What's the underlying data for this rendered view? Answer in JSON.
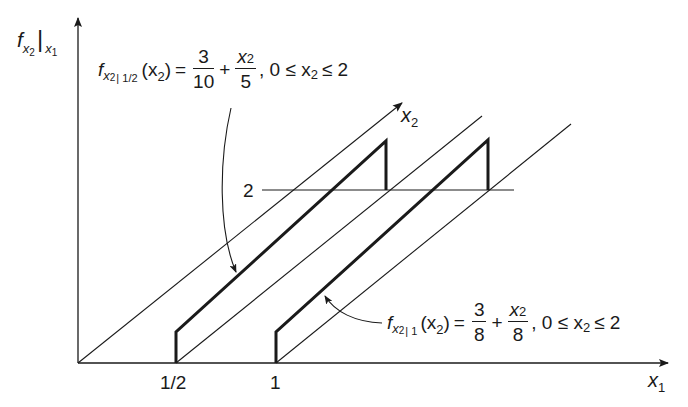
{
  "diagram": {
    "type": "3d-conditional-density-plot",
    "colors": {
      "ink": "#1a1a1a",
      "background": "#ffffff"
    },
    "axes": {
      "vertical": {
        "label_f": "f",
        "label_sub": "x",
        "label_sub_idx": "2",
        "label_bar": "|",
        "label_cond": "x",
        "label_cond_idx": "1"
      },
      "horizontal": {
        "label": "x",
        "label_idx": "1"
      },
      "depth": {
        "label": "x",
        "label_idx": "2"
      }
    },
    "ticks": {
      "x1": [
        {
          "label": "1/2"
        },
        {
          "label": "1"
        }
      ],
      "x2": [
        {
          "label": "2"
        }
      ]
    },
    "curves": [
      {
        "name": "conditional-density-half",
        "f": "f",
        "sub_var": "x",
        "sub_idx": "2",
        "cond": "| 1/2",
        "arg": "(x",
        "arg_idx": "2",
        "arg_close": ")",
        "eq": "=",
        "frac1_num": "3",
        "frac1_den": "10",
        "plus": "+",
        "frac2_num_var": "x",
        "frac2_num_idx": "2",
        "frac2_den": "5",
        "range": ", 0 ≤ x",
        "range_idx": "2",
        "range_end": "≤ 2"
      },
      {
        "name": "conditional-density-one",
        "f": "f",
        "sub_var": "x",
        "sub_idx": "2",
        "cond": "| 1",
        "arg": "(x",
        "arg_idx": "2",
        "arg_close": ")",
        "eq": "=",
        "frac1_num": "3",
        "frac1_den": "8",
        "plus": "+",
        "frac2_num_var": "x",
        "frac2_num_idx": "2",
        "frac2_den": "8",
        "range": ", 0 ≤ x",
        "range_idx": "2",
        "range_end": "≤ 2"
      }
    ]
  }
}
